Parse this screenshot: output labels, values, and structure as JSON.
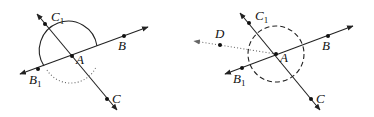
{
  "figures": [
    {
      "id": "left",
      "labels": {
        "C1": "C",
        "C1_sub": "1",
        "B": "B",
        "A": "A",
        "B1": "B",
        "B1_sub": "1",
        "C": "C"
      },
      "arcs": [
        "solid upper semicircle centered at A",
        "dotted lower arc"
      ]
    },
    {
      "id": "right",
      "labels": {
        "C1": "C",
        "C1_sub": "1",
        "B": "B",
        "A": "A",
        "B1": "B",
        "B1_sub": "1",
        "C": "C",
        "D": "D"
      },
      "arcs": [
        "dashed circle centered at A",
        "dotted ray A to D"
      ]
    }
  ]
}
